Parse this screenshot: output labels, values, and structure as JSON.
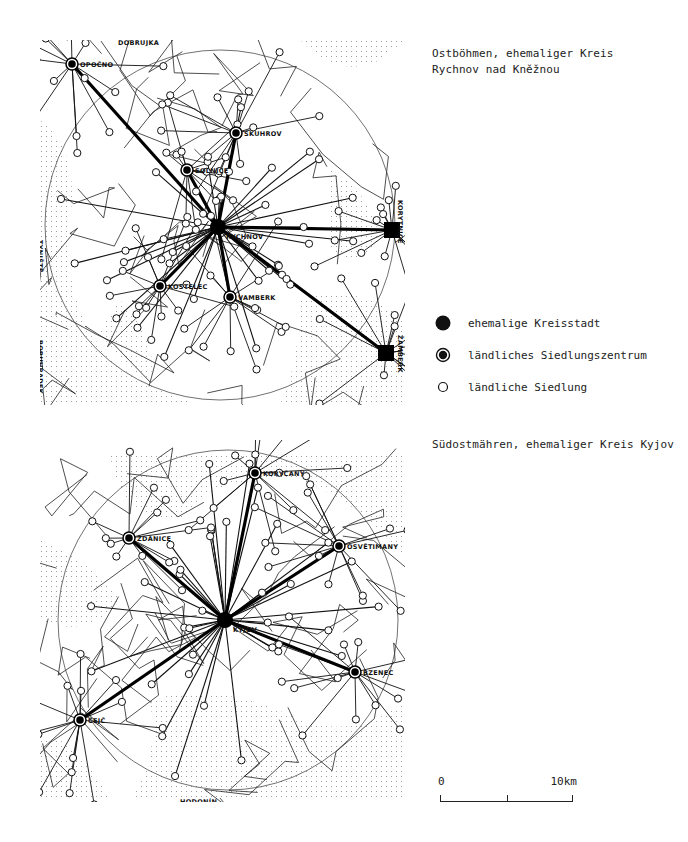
{
  "maps": [
    {
      "id": "rychnov",
      "caption_line1": "Ostböhmen, ehemaliger Kreis",
      "caption_line2": "Rychnov nad Kněžnou",
      "district_town": {
        "name": "RYCHNOV",
        "x": 218,
        "y": 227
      },
      "rural_centers": [
        {
          "name": "OPOČNO",
          "x": 72,
          "y": 64
        },
        {
          "name": "SOLNICE",
          "x": 187,
          "y": 170
        },
        {
          "name": "SKUHROV",
          "x": 236,
          "y": 133
        },
        {
          "name": "KOSTELEC",
          "x": 160,
          "y": 286
        },
        {
          "name": "VAMBERK",
          "x": 230,
          "y": 297
        }
      ],
      "edge_towns": [
        {
          "name": "ŽAMBERK",
          "x": 386,
          "y": 353
        },
        {
          "name": "KORYTNICE",
          "x": 392,
          "y": 230
        }
      ],
      "border_labels": [
        {
          "name": "DOBRUJKA",
          "x": 118,
          "y": 45,
          "rotate": 0
        },
        {
          "name": "TYNIŠTĚ",
          "x": 38,
          "y": 240,
          "rotate": 90
        },
        {
          "name": "BORUHRADEK",
          "x": 38,
          "y": 340,
          "rotate": 90
        },
        {
          "name": "BRANDÝS n/ORL.",
          "x": 168,
          "y": 411,
          "rotate": 0
        },
        {
          "name": "ÚSTÍ n/ORL.",
          "x": 273,
          "y": 411,
          "rotate": 0
        },
        {
          "name": "KORYTNICE",
          "x": 398,
          "y": 200,
          "rotate": 90
        },
        {
          "name": "ŽAMBERK",
          "x": 398,
          "y": 335,
          "rotate": 90
        }
      ],
      "circle": {
        "cx": 220,
        "cy": 225,
        "r": 175
      }
    },
    {
      "id": "kyjov",
      "caption": "Südostmähren, ehemaliger Kreis Kyjov",
      "district_town": {
        "name": "KYJOV",
        "x": 225,
        "y": 620
      },
      "rural_centers": [
        {
          "name": "KORYČANY",
          "x": 255,
          "y": 473
        },
        {
          "name": "ŽDÁNICE",
          "x": 129,
          "y": 538
        },
        {
          "name": "OSVĚTIMANY",
          "x": 339,
          "y": 546
        },
        {
          "name": "BZENEC",
          "x": 355,
          "y": 672
        },
        {
          "name": "ČEJČ",
          "x": 80,
          "y": 720
        }
      ],
      "border_labels": [
        {
          "name": "BUČOVICE",
          "x": 80,
          "y": 440,
          "rotate": 0
        },
        {
          "name": "HODONÍN",
          "x": 180,
          "y": 804,
          "rotate": 0
        }
      ],
      "circle": {
        "cx": 228,
        "cy": 620,
        "r": 170
      }
    }
  ],
  "legend": [
    {
      "symbol": "filled-dot",
      "label": "ehemalige Kreisstadt"
    },
    {
      "symbol": "ringed-dot",
      "label": "ländliches Siedlungszentrum"
    },
    {
      "symbol": "open-circle",
      "label": "ländliche Siedlung"
    }
  ],
  "scale_bar": {
    "start_label": "0",
    "end_label": "10km"
  },
  "colors": {
    "ink": "#111111",
    "paper": "#ffffff",
    "stipple": "#9a9a9a"
  }
}
